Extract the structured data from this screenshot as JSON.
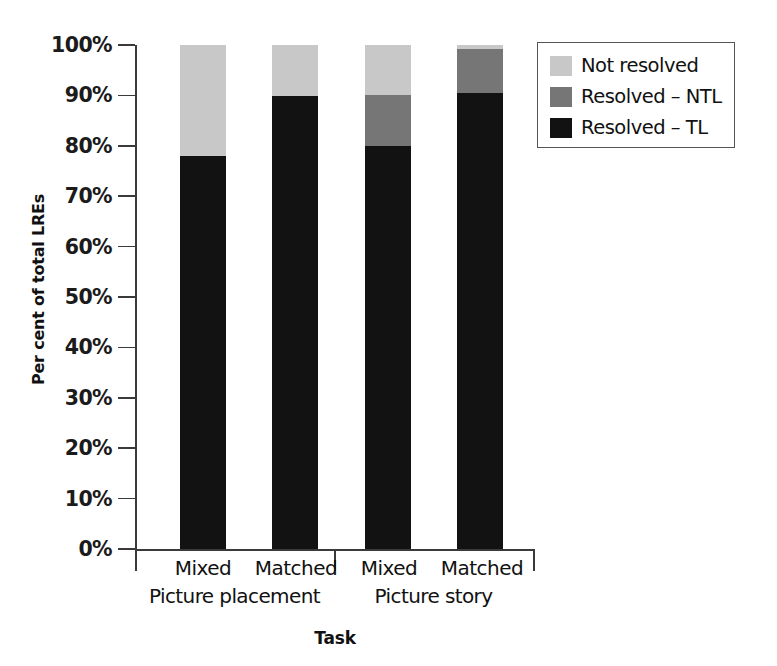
{
  "chart_data": {
    "type": "bar",
    "subtype": "stacked-bar-100",
    "title": "",
    "xlabel": "Task",
    "ylabel": "Per cent of total LREs",
    "ylim": [
      0,
      100
    ],
    "yticks": [
      0,
      10,
      20,
      30,
      40,
      50,
      60,
      70,
      80,
      90,
      100
    ],
    "ytick_labels": [
      "0%",
      "10%",
      "20%",
      "30%",
      "40%",
      "50%",
      "60%",
      "70%",
      "80%",
      "90%",
      "100%"
    ],
    "grid": false,
    "legend_position": "top-right",
    "categories": [
      "Mixed",
      "Matched",
      "Mixed",
      "Matched"
    ],
    "groups": [
      {
        "label": "Picture placement",
        "categories": [
          "Mixed",
          "Matched"
        ]
      },
      {
        "label": "Picture story",
        "categories": [
          "Mixed",
          "Matched"
        ]
      }
    ],
    "series": [
      {
        "name": "Resolved – TL",
        "color": "#121212",
        "values": [
          78.0,
          89.8,
          80.0,
          90.5
        ]
      },
      {
        "name": "Resolved – NTL",
        "color": "#767676",
        "values": [
          0.0,
          0.0,
          10.1,
          8.7
        ]
      },
      {
        "name": "Not resolved",
        "color": "#c8c8c8",
        "values": [
          22.0,
          10.2,
          9.9,
          0.8
        ]
      }
    ]
  },
  "axes": {
    "ylabel": "Per cent of total LREs",
    "xlabel": "Task",
    "ytick_labels": [
      "100%",
      "90%",
      "80%",
      "70%",
      "60%",
      "50%",
      "40%",
      "30%",
      "20%",
      "10%",
      "0%"
    ],
    "category_labels": [
      "Mixed",
      "Matched",
      "Mixed",
      "Matched"
    ],
    "group_labels": [
      "Picture placement",
      "Picture story"
    ]
  },
  "legend": {
    "items": [
      {
        "label": "Not resolved",
        "color": "#c8c8c8"
      },
      {
        "label": "Resolved – NTL",
        "color": "#767676"
      },
      {
        "label": "Resolved – TL",
        "color": "#121212"
      }
    ]
  },
  "colors": {
    "not_resolved": "#c8c8c8",
    "resolved_ntl": "#767676",
    "resolved_tl": "#121212",
    "axis": "#3a3a3a",
    "text": "#111111",
    "background": "#ffffff"
  }
}
